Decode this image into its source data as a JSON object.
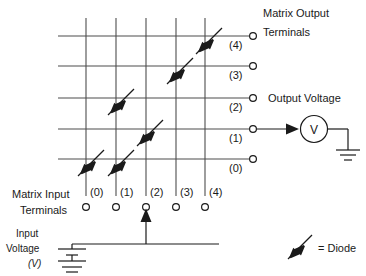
{
  "diagram": {
    "title_matrix_output": "Matrix Output",
    "title_terminals_out": "Terminals",
    "title_matrix_input": "Matrix Input",
    "title_terminals_in": "Terminals",
    "output_voltage_label": "Output Voltage",
    "input_voltage_line1": "Input",
    "input_voltage_line2": "Voltage",
    "input_voltage_unit": "(V)",
    "voltmeter_symbol": "V",
    "legend_text": "= Diode",
    "output_terminal_labels": [
      "(0)",
      "(1)",
      "(2)",
      "(3)",
      "(4)"
    ],
    "input_terminal_labels": [
      "(0)",
      "(1)",
      "(2)",
      "(3)",
      "(4)"
    ],
    "colors": {
      "wire": "#4d4d4d",
      "ink": "#1a1a1a",
      "background": "#ffffff"
    },
    "matrix": {
      "rows": 5,
      "columns": 5,
      "diode_connections": [
        {
          "column": "(0)",
          "row": "(0)"
        },
        {
          "column": "(1)",
          "row": "(0)"
        },
        {
          "column": "(1)",
          "row": "(2)"
        },
        {
          "column": "(2)",
          "row": "(1)"
        },
        {
          "column": "(3)",
          "row": "(3)"
        },
        {
          "column": "(4)",
          "row": "(4)"
        }
      ],
      "driven_input_terminal": "(2)",
      "metered_output_terminal": "(1)"
    }
  }
}
